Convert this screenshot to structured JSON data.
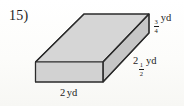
{
  "problem": {
    "number": "15)"
  },
  "figure": {
    "shape_name": "rectangular-prism",
    "faces": {
      "top_fill": "#d6d6d6",
      "front_fill": "#d2d2d2",
      "side_fill": "#c6c6c6",
      "stroke": "#2b2b2b"
    }
  },
  "labels": {
    "height": {
      "whole": "",
      "numerator": "3",
      "denominator": "4",
      "unit": "yd",
      "full_text": "3/4 yd"
    },
    "depth": {
      "whole": "2",
      "numerator": "1",
      "denominator": "2",
      "unit": "yd",
      "full_text": "2 1/2 yd"
    },
    "width": {
      "value": "2",
      "unit": "yd",
      "full_text": "2 yd"
    }
  },
  "colors": {
    "background": "#fdfdfb",
    "ink": "#1c1c1c"
  }
}
